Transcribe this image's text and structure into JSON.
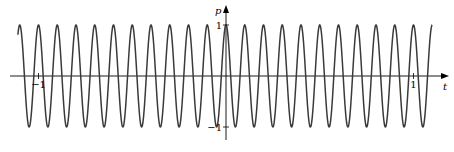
{
  "chart_data": {
    "type": "line",
    "title": "",
    "xlabel": "t",
    "ylabel": "p",
    "function": "p = cos(20*pi*t)",
    "frequency_hz": 10,
    "xlim": [
      -1.11,
      1.1
    ],
    "ylim": [
      -1,
      1
    ],
    "x_ticks": [
      {
        "value": -1,
        "label": "−1"
      },
      {
        "value": 1,
        "label": "1"
      }
    ],
    "y_ticks": [
      {
        "value": 1,
        "label": "1"
      },
      {
        "value": -1,
        "label": "−1"
      }
    ],
    "grid": false,
    "legend": "none",
    "series": [
      {
        "name": "p(t)",
        "color": "#3a3a3a"
      }
    ]
  }
}
